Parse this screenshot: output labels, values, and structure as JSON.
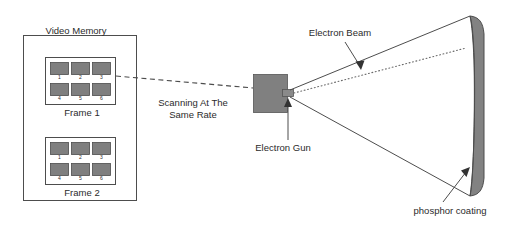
{
  "diagram": {
    "title_label": "Video Memory",
    "labels": {
      "video_memory": "Video Memory",
      "frame_1": "Frame 1",
      "frame_2": "Frame 2",
      "scanning": "Scanning At The\nSame Rate",
      "scanning_line_1": "Scanning At The",
      "scanning_line_2": "Same Rate",
      "electron_gun": "Electron Gun",
      "electron_beam": "Electron Beam",
      "phosphor_coating": "phosphor coating"
    },
    "frames": [
      {
        "name": "Frame 1",
        "caption": "Frame 1",
        "cells": [
          "1",
          "2",
          "3",
          "4",
          "5",
          "6"
        ]
      },
      {
        "name": "Frame 2",
        "caption": "Frame 2",
        "cells": [
          "1",
          "2",
          "3",
          "4",
          "5",
          "6"
        ]
      }
    ],
    "colors": {
      "fill_gray": "#808080",
      "cell_gray": "#7f7f7f",
      "screen_gray": "#828282",
      "stroke": "#4d4d4d",
      "text": "#2b2b2b",
      "background": "#ffffff"
    },
    "connectors": [
      {
        "name": "scanning-dashed-line",
        "style": "dashed"
      },
      {
        "name": "beam-center-dotted-line",
        "style": "dotted"
      },
      {
        "name": "cone-upper-edge",
        "style": "solid"
      },
      {
        "name": "cone-lower-edge",
        "style": "solid"
      }
    ],
    "pointers": [
      {
        "name": "electron-beam-arrow",
        "target": "electron beam cone"
      },
      {
        "name": "electron-gun-arrow",
        "target": "electron gun nozzle"
      },
      {
        "name": "phosphor-coating-arrow",
        "target": "screen inner surface"
      }
    ]
  }
}
